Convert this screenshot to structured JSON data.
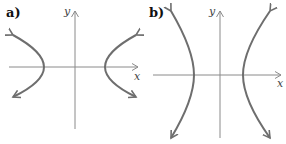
{
  "panels": [
    {
      "id": "a",
      "label": "a)",
      "x_axis_label": "x",
      "y_axis_label": "y",
      "orientation": "horizontal-opening hyperbola"
    },
    {
      "id": "b",
      "label": "b)",
      "x_axis_label": "x",
      "y_axis_label": "y",
      "orientation": "horizontal-opening hyperbola (wider, steeper)"
    }
  ],
  "colors": {
    "axis": "#8a8a8a",
    "curve": "#6e6e6e",
    "text": "#222222"
  }
}
